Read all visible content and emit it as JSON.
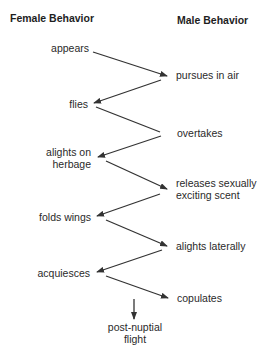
{
  "diagram": {
    "headers": {
      "female": "Female Behavior",
      "male": "Male Behavior"
    },
    "female_steps": [
      {
        "lines": [
          "appears"
        ]
      },
      {
        "lines": [
          "flies"
        ]
      },
      {
        "lines": [
          "alights on",
          "herbage"
        ]
      },
      {
        "lines": [
          "folds wings"
        ]
      },
      {
        "lines": [
          "acquiesces"
        ]
      }
    ],
    "male_steps": [
      {
        "lines": [
          "pursues in air"
        ]
      },
      {
        "lines": [
          "overtakes"
        ]
      },
      {
        "lines": [
          "releases sexually",
          "exciting scent"
        ]
      },
      {
        "lines": [
          "alights laterally"
        ]
      },
      {
        "lines": [
          "copulates"
        ]
      }
    ],
    "final_step": {
      "lines": [
        "post-nuptial",
        "flight"
      ]
    },
    "colors": {
      "text": "#2a2a2a",
      "arrow": "#333333",
      "background": "#ffffff"
    }
  }
}
